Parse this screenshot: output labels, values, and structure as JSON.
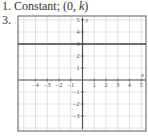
{
  "header": {
    "item1_number": "1.",
    "item1_text": "Constant; (0, ",
    "item1_var": "k",
    "item1_close": ")",
    "item3_number": "3."
  },
  "chart_data": {
    "type": "line",
    "title": "",
    "xlabel": "x",
    "ylabel": "y",
    "xlim": [
      -5.5,
      5.5
    ],
    "ylim": [
      -4.3,
      5.3
    ],
    "grid": true,
    "x_tick_labels": [
      "-4",
      "-3",
      "-2",
      "-1",
      "1",
      "2",
      "3",
      "4",
      "5"
    ],
    "y_tick_labels": [
      "5",
      "4",
      "3",
      "2",
      "1",
      "-1",
      "-2",
      "-3"
    ],
    "series": [
      {
        "name": "y = 3",
        "x": [
          -5.5,
          5.5
        ],
        "y": [
          3,
          3
        ]
      }
    ],
    "colors": {
      "grid": "#d9d9d9",
      "axis": "#555555",
      "line": "#444444",
      "frame": "#777777"
    }
  }
}
